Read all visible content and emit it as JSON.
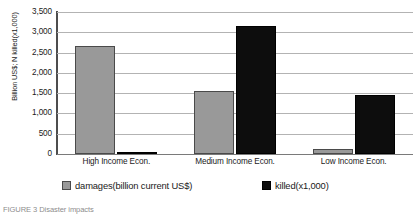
{
  "chart_data": {
    "type": "bar",
    "title": "",
    "subtitle": "",
    "xlabel": "",
    "ylabel": "Billion US$; N killed(x1,000)",
    "categories": [
      "High Income Econ.",
      "Medium Income Econ.",
      "Low Income Econ."
    ],
    "series": [
      {
        "name": "damages(billion current US$)",
        "color": "#999999",
        "values": [
          2650,
          1550,
          130
        ]
      },
      {
        "name": "killed(x1,000)",
        "color": "#0d0d0d",
        "values": [
          60,
          3150,
          1450
        ]
      }
    ],
    "ylim": [
      0,
      3500
    ],
    "yticks": [
      0,
      500,
      1000,
      1500,
      2000,
      2500,
      3000,
      3500
    ],
    "ytick_labels": [
      "0",
      "500",
      "1,000",
      "1,500",
      "2,000",
      "2,500",
      "3,000",
      "3,500"
    ],
    "grid": true,
    "grid_axis": "y",
    "legend_position": "bottom"
  },
  "caption": {
    "text": "FIGURE 3 Disaster impacts"
  }
}
